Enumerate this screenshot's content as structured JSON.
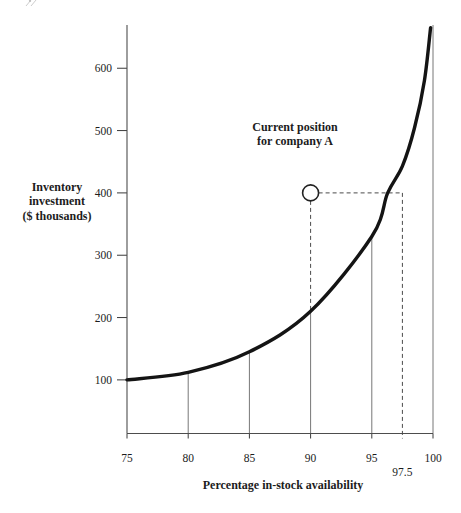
{
  "figure": {
    "background": "#ffffff",
    "annotation": {
      "line1": "Current position",
      "line2": "for company A"
    },
    "y_axis_label": {
      "line1": "Inventory",
      "line2": "investment",
      "line3": "($ thousands)"
    },
    "x_axis_label": "Percentage in-stock availability",
    "colors": {
      "curve": "#141414",
      "thin_line": "#777777",
      "dashed_line": "#4a4a4a",
      "axis": "#4d4d4d",
      "text": "#1c1c1c"
    }
  },
  "chart_data": {
    "type": "line",
    "title": "",
    "xlabel": "Percentage in-stock availability",
    "ylabel": "Inventory investment ($ thousands)",
    "xlim": [
      75,
      100
    ],
    "ylim": [
      15,
      670
    ],
    "grid": "off",
    "legend": "none",
    "x_ticks": [
      75,
      80,
      85,
      90,
      95,
      100
    ],
    "x_tick_labels": [
      "75",
      "80",
      "85",
      "90",
      "95",
      "100"
    ],
    "extra_x_tick": {
      "value": 97.5,
      "label": "97.5"
    },
    "y_ticks": [
      100,
      200,
      300,
      400,
      500,
      600
    ],
    "y_tick_labels": [
      "100",
      "200",
      "300",
      "400",
      "500",
      "600"
    ],
    "curve_points": [
      [
        75,
        100
      ],
      [
        80,
        112
      ],
      [
        85,
        145
      ],
      [
        90,
        210
      ],
      [
        95,
        330
      ],
      [
        96.3,
        400
      ],
      [
        97.5,
        443
      ],
      [
        98.5,
        505
      ],
      [
        99.3,
        580
      ],
      [
        99.8,
        665
      ]
    ],
    "drop_line_xs": [
      80,
      85,
      90,
      95,
      100
    ],
    "current_position": {
      "x": 90,
      "y": 400,
      "label": "Current position for company A",
      "target_availability": 97.5
    }
  }
}
